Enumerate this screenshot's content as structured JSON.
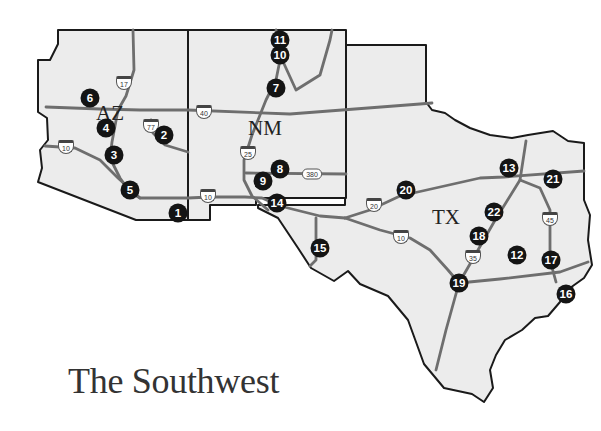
{
  "title": "The Southwest",
  "states": [
    {
      "abbr": "AZ",
      "x": 96,
      "y": 103
    },
    {
      "abbr": "NM",
      "x": 248,
      "y": 118
    },
    {
      "abbr": "TX",
      "x": 432,
      "y": 207
    }
  ],
  "markers": [
    {
      "n": "1",
      "x": 178,
      "y": 213
    },
    {
      "n": "2",
      "x": 164,
      "y": 135
    },
    {
      "n": "3",
      "x": 114,
      "y": 155
    },
    {
      "n": "4",
      "x": 106,
      "y": 128
    },
    {
      "n": "5",
      "x": 130,
      "y": 190
    },
    {
      "n": "6",
      "x": 90,
      "y": 98
    },
    {
      "n": "7",
      "x": 276,
      "y": 88
    },
    {
      "n": "8",
      "x": 280,
      "y": 169
    },
    {
      "n": "9",
      "x": 263,
      "y": 181
    },
    {
      "n": "10",
      "x": 280,
      "y": 55
    },
    {
      "n": "11",
      "x": 280,
      "y": 40
    },
    {
      "n": "12",
      "x": 517,
      "y": 255
    },
    {
      "n": "13",
      "x": 509,
      "y": 168
    },
    {
      "n": "14",
      "x": 277,
      "y": 203
    },
    {
      "n": "15",
      "x": 320,
      "y": 248
    },
    {
      "n": "16",
      "x": 566,
      "y": 294
    },
    {
      "n": "17",
      "x": 551,
      "y": 260
    },
    {
      "n": "18",
      "x": 479,
      "y": 236
    },
    {
      "n": "19",
      "x": 459,
      "y": 283
    },
    {
      "n": "20",
      "x": 406,
      "y": 190
    },
    {
      "n": "21",
      "x": 553,
      "y": 179
    },
    {
      "n": "22",
      "x": 494,
      "y": 212
    }
  ],
  "highways": [
    {
      "label": "17",
      "type": "interstate",
      "x": 124,
      "y": 83
    },
    {
      "label": "77",
      "type": "interstate",
      "x": 151,
      "y": 126
    },
    {
      "label": "10",
      "type": "interstate",
      "x": 66,
      "y": 147
    },
    {
      "label": "40",
      "type": "interstate",
      "x": 204,
      "y": 112
    },
    {
      "label": "25",
      "type": "interstate",
      "x": 248,
      "y": 153
    },
    {
      "label": "380",
      "type": "us",
      "x": 312,
      "y": 174
    },
    {
      "label": "10",
      "type": "interstate",
      "x": 208,
      "y": 196
    },
    {
      "label": "20",
      "type": "interstate",
      "x": 374,
      "y": 205
    },
    {
      "label": "10",
      "type": "interstate",
      "x": 401,
      "y": 237
    },
    {
      "label": "35",
      "type": "interstate",
      "x": 473,
      "y": 257
    },
    {
      "label": "45",
      "type": "interstate",
      "x": 550,
      "y": 219
    }
  ]
}
